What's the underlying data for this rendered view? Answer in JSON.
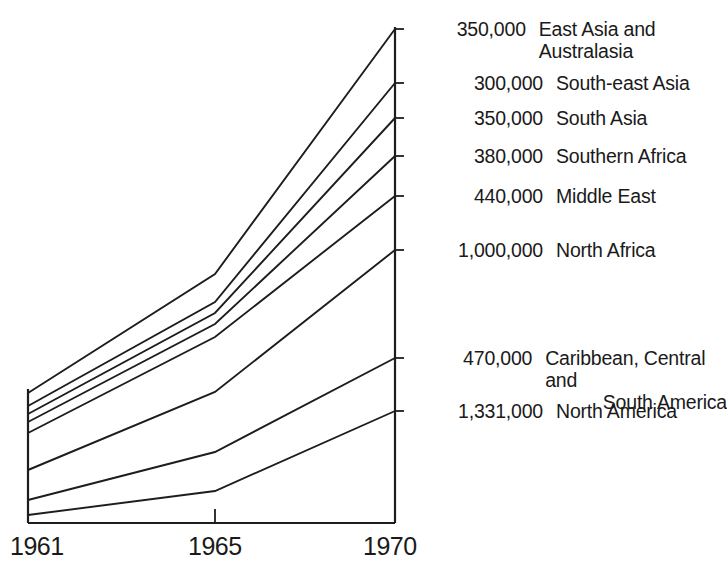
{
  "chart_data": {
    "type": "line",
    "title": "",
    "subtitle": "",
    "xlabel": "",
    "ylabel": "",
    "x": [
      "1961",
      "1965",
      "1970"
    ],
    "xtick_labels": [
      "1961",
      "1965",
      "1970"
    ],
    "grid": false,
    "legend_position": "right",
    "axis_style": "left-right-bottom frame, ticks at right axis for each series",
    "note": "Fan / ribbon chart of migration flows by region; values shown are the 1970 end-point totals printed at the right of each line.",
    "series": [
      {
        "name": "East Asia and Australasia",
        "value_1970": "350,000",
        "value_1970_numeric": 350000,
        "points_px": [
          [
            28,
            393
          ],
          [
            215,
            274
          ],
          [
            395,
            29
          ]
        ]
      },
      {
        "name": "South-east Asia",
        "value_1970": "300,000",
        "value_1970_numeric": 300000,
        "points_px": [
          [
            28,
            406
          ],
          [
            215,
            302
          ],
          [
            395,
            83
          ]
        ]
      },
      {
        "name": "South Asia",
        "value_1970": "350,000",
        "value_1970_numeric": 350000,
        "points_px": [
          [
            28,
            414
          ],
          [
            215,
            313
          ],
          [
            395,
            118
          ]
        ]
      },
      {
        "name": "Southern Africa",
        "value_1970": "380,000",
        "value_1970_numeric": 380000,
        "points_px": [
          [
            28,
            422
          ],
          [
            215,
            324
          ],
          [
            395,
            156
          ]
        ]
      },
      {
        "name": "Middle East",
        "value_1970": "440,000",
        "value_1970_numeric": 440000,
        "points_px": [
          [
            28,
            433
          ],
          [
            215,
            337
          ],
          [
            395,
            196
          ]
        ]
      },
      {
        "name": "North Africa",
        "value_1970": "1,000,000",
        "value_1970_numeric": 1000000,
        "points_px": [
          [
            28,
            470
          ],
          [
            215,
            392
          ],
          [
            395,
            250
          ]
        ]
      },
      {
        "name": "Caribbean, Central and South America",
        "value_1970": "470,000",
        "value_1970_numeric": 470000,
        "points_px": [
          [
            28,
            500
          ],
          [
            215,
            452
          ],
          [
            395,
            358
          ]
        ]
      },
      {
        "name": "North America",
        "value_1970": "1,331,000",
        "value_1970_numeric": 1331000,
        "points_px": [
          [
            28,
            515
          ],
          [
            215,
            491
          ],
          [
            395,
            411
          ]
        ]
      }
    ]
  },
  "legend": {
    "entries": [
      {
        "value": "350,000",
        "label": "East Asia and Australasia",
        "y": 18
      },
      {
        "value": "300,000",
        "label": "South-east Asia",
        "y": 72
      },
      {
        "value": "350,000",
        "label": "South Asia",
        "y": 107
      },
      {
        "value": "380,000",
        "label": "Southern Africa",
        "y": 145
      },
      {
        "value": "440,000",
        "label": "Middle East",
        "y": 185
      },
      {
        "value": "1,000,000",
        "label": "North Africa",
        "y": 239
      },
      {
        "value": "470,000",
        "label": "Caribbean, Central and\nSouth America",
        "y": 347
      },
      {
        "value": "1,331,000",
        "label": "North America",
        "y": 400
      }
    ]
  },
  "xaxis": {
    "ticks": [
      {
        "label": "1961",
        "x": 10,
        "y": 532
      },
      {
        "label": "1965",
        "x": 188,
        "y": 532
      },
      {
        "label": "1970",
        "x": 363,
        "y": 532
      }
    ]
  },
  "colors": {
    "ink": "#1d1d1d",
    "background": "#ffffff"
  }
}
